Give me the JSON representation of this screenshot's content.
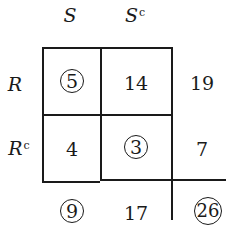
{
  "diagram": {
    "column_headers": [
      {
        "label": "S",
        "sup": ""
      },
      {
        "label": "S",
        "sup": "c"
      }
    ],
    "row_headers": [
      {
        "label": "R",
        "sup": ""
      },
      {
        "label": "R",
        "sup": "c"
      }
    ],
    "cells": [
      [
        {
          "value": "5",
          "circled": true
        },
        {
          "value": "14",
          "circled": false
        }
      ],
      [
        {
          "value": "4",
          "circled": false
        },
        {
          "value": "3",
          "circled": true
        }
      ]
    ],
    "row_totals": [
      {
        "value": "19",
        "circled": false
      },
      {
        "value": "7",
        "circled": false
      }
    ],
    "column_totals": [
      {
        "value": "9",
        "circled": true
      },
      {
        "value": "17",
        "circled": false
      }
    ],
    "grand_total": {
      "value": "26",
      "circled": true
    }
  }
}
